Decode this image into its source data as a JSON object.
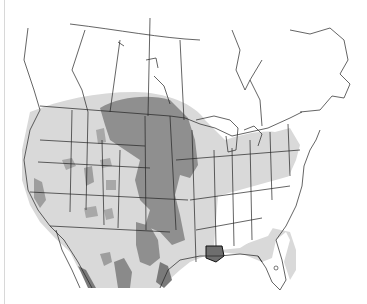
{
  "map": {
    "type": "range-map",
    "region": "North America",
    "colors": {
      "background": "#ffffff",
      "range_light": "#d9d9d9",
      "range_medium": "#bdbdbd",
      "range_dark": "#8f8f8f",
      "range_darkest": "#6e6e6e",
      "border": "#222222"
    },
    "layers": [
      "light-range",
      "dark-core-range",
      "political-boundaries"
    ]
  }
}
